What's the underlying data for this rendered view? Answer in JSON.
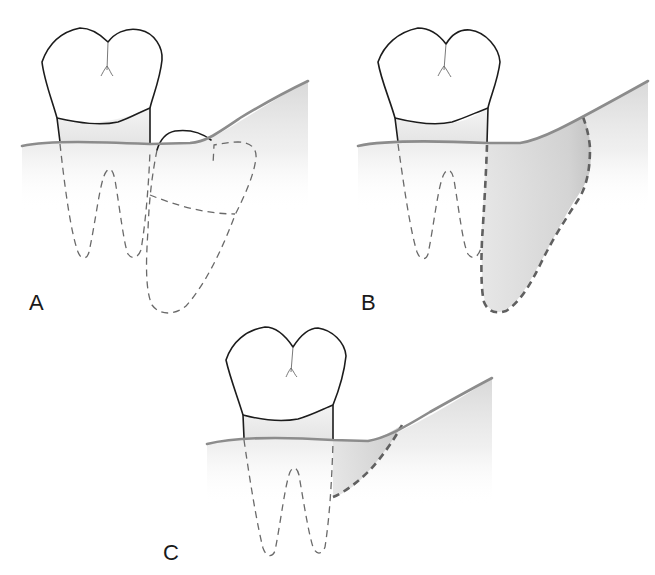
{
  "figure": {
    "panels": [
      {
        "id": "A",
        "label": "A",
        "description": "Erupted molar with impacted adjacent tooth (dashed) beneath gingiva"
      },
      {
        "id": "B",
        "label": "B",
        "description": "Molar with large bony defect (shaded, bold dashed) distal to root after removal of impacted tooth"
      },
      {
        "id": "C",
        "label": "C",
        "description": "Molar with reduced, filled-in bony defect distal to root"
      }
    ]
  },
  "colors": {
    "outline": "#1c1c1c",
    "gum_line": "#8c8c8c",
    "dashed_root": "#6a6a6a",
    "defect_line": "#606060",
    "bone_fill": "#d9d9d9",
    "defect_fill": "#c8c8c8"
  }
}
